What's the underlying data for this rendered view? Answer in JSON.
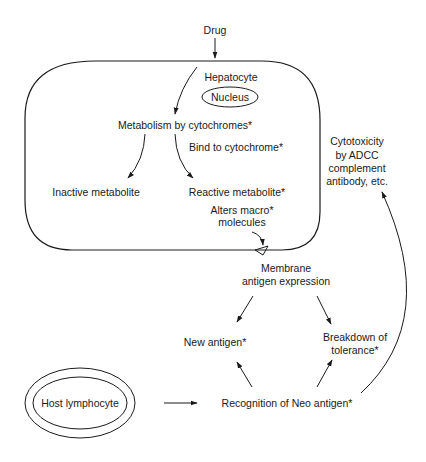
{
  "diagram": {
    "type": "flow",
    "nodes": {
      "drug": "Drug",
      "hepatocyte": "Hepatocyte",
      "nucleus": "Nucleus",
      "metabolism": "Metabolism by cytochromes*",
      "bind": "Bind to cytochrome*",
      "inactive": "Inactive metabolite",
      "reactive": "Reactive metabolite*",
      "alters": [
        "Alters macro*",
        "molecules"
      ],
      "membrane": [
        "Membrane",
        "antigen expression"
      ],
      "new_antigen": "New antigen*",
      "breakdown": [
        "Breakdown of",
        "tolerance*"
      ],
      "host": "Host lymphocyte",
      "recognition": "Recognition of Neo antigen*",
      "cytotoxicity": [
        "Cytotoxicity",
        "by ADCC",
        "complement",
        "antibody, etc."
      ]
    },
    "edges": [
      {
        "from": "Drug",
        "to": "Hepatocyte"
      },
      {
        "from": "Drug",
        "to": "Metabolism by cytochromes*"
      },
      {
        "from": "Metabolism by cytochromes*",
        "to": "Inactive metabolite"
      },
      {
        "from": "Metabolism by cytochromes*",
        "to": "Reactive metabolite*",
        "label": "Bind to cytochrome*"
      },
      {
        "from": "Alters macro* molecules",
        "to": "Membrane"
      },
      {
        "from": "Membrane antigen expression",
        "to": "New antigen*"
      },
      {
        "from": "Membrane antigen expression",
        "to": "Breakdown of tolerance*"
      },
      {
        "from": "Host lymphocyte",
        "to": "Recognition of Neo antigen*"
      },
      {
        "from": "Recognition of Neo antigen*",
        "to": "New antigen*"
      },
      {
        "from": "Recognition of Neo antigen*",
        "to": "Breakdown of tolerance*"
      },
      {
        "from": "Recognition of Neo antigen*",
        "to": "Cytotoxicity by ADCC complement antibody, etc."
      }
    ],
    "colors": {
      "ink": "#1a1a1a",
      "background": "#ffffff"
    }
  }
}
